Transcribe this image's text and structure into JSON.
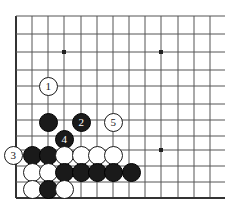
{
  "figure": {
    "type": "go-board-diagram",
    "title": "",
    "board_background": "#ffffff",
    "line_color": "#555555",
    "edge_color": "#333333",
    "black_stone_color": "#1a1a1a",
    "white_stone_color": "#ffffff",
    "stone_diameter": 19,
    "grid": {
      "x_lines": [
        16,
        32,
        48,
        64,
        81,
        97,
        113,
        129,
        145,
        161,
        178,
        194,
        210
      ],
      "y_lines": [
        16,
        34,
        52,
        70,
        86,
        104,
        120,
        136,
        150,
        166,
        182,
        198
      ],
      "left_edge_x": 16,
      "bottom_edge_y": 198,
      "columns": 13,
      "rows": 12
    },
    "star_points": [
      {
        "x": 64,
        "y": 52
      },
      {
        "x": 161,
        "y": 52
      },
      {
        "x": 161,
        "y": 150
      }
    ],
    "stones": [
      {
        "id": "stone-white-1",
        "color": "white",
        "label": "1",
        "x": 48,
        "y": 86
      },
      {
        "id": "stone-black-a",
        "color": "black",
        "label": "",
        "x": 48,
        "y": 122
      },
      {
        "id": "stone-black-2",
        "color": "black",
        "label": "2",
        "x": 81,
        "y": 122
      },
      {
        "id": "stone-white-5",
        "color": "white",
        "label": "5",
        "x": 113,
        "y": 122
      },
      {
        "id": "stone-black-4",
        "color": "black",
        "label": "4",
        "x": 64,
        "y": 139
      },
      {
        "id": "stone-white-3",
        "color": "white",
        "label": "3",
        "x": 13,
        "y": 155
      },
      {
        "id": "stone-black-b",
        "color": "black",
        "label": "",
        "x": 32,
        "y": 155
      },
      {
        "id": "stone-black-c",
        "color": "black",
        "label": "",
        "x": 48,
        "y": 155
      },
      {
        "id": "stone-white-d",
        "color": "white",
        "label": "",
        "x": 64,
        "y": 155
      },
      {
        "id": "stone-white-e",
        "color": "white",
        "label": "",
        "x": 81,
        "y": 155
      },
      {
        "id": "stone-white-f",
        "color": "white",
        "label": "",
        "x": 97,
        "y": 155
      },
      {
        "id": "stone-white-g",
        "color": "white",
        "label": "",
        "x": 113,
        "y": 155
      },
      {
        "id": "stone-white-h",
        "color": "white",
        "label": "",
        "x": 32,
        "y": 172
      },
      {
        "id": "stone-white-i",
        "color": "white",
        "label": "",
        "x": 48,
        "y": 172
      },
      {
        "id": "stone-black-j",
        "color": "black",
        "label": "",
        "x": 64,
        "y": 172
      },
      {
        "id": "stone-black-k",
        "color": "black",
        "label": "",
        "x": 81,
        "y": 172
      },
      {
        "id": "stone-black-l",
        "color": "black",
        "label": "",
        "x": 97,
        "y": 172
      },
      {
        "id": "stone-black-m",
        "color": "black",
        "label": "",
        "x": 113,
        "y": 172
      },
      {
        "id": "stone-black-n",
        "color": "black",
        "label": "",
        "x": 131,
        "y": 172
      },
      {
        "id": "stone-white-o",
        "color": "white",
        "label": "",
        "x": 32,
        "y": 189
      },
      {
        "id": "stone-black-p",
        "color": "black",
        "label": "",
        "x": 48,
        "y": 189
      },
      {
        "id": "stone-white-q",
        "color": "white",
        "label": "",
        "x": 64,
        "y": 189
      }
    ],
    "move_sequence": [
      {
        "number": "1",
        "color": "white"
      },
      {
        "number": "2",
        "color": "black"
      },
      {
        "number": "3",
        "color": "white"
      },
      {
        "number": "4",
        "color": "black"
      },
      {
        "number": "5",
        "color": "white"
      }
    ]
  }
}
